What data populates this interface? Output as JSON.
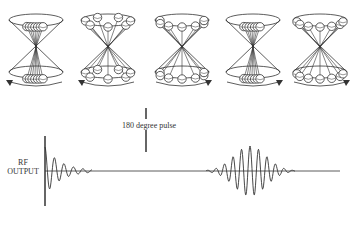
{
  "diagram": {
    "title": "",
    "cones": [
      {
        "id": 1,
        "state": "spins clustered in phase",
        "spread": 0.15,
        "rotation": "counterclockwise"
      },
      {
        "id": 2,
        "state": "spins dephased",
        "spread": 1.0,
        "rotation": "counterclockwise"
      },
      {
        "id": 3,
        "state": "spins dephasing / refocusing after inversion",
        "spread": 0.7,
        "rotation": "clockwise"
      },
      {
        "id": 4,
        "state": "spins rephased (echo)",
        "spread": 0.15,
        "rotation": "clockwise"
      },
      {
        "id": 5,
        "state": "spins dephasing again",
        "spread": 0.6,
        "rotation": "clockwise"
      }
    ],
    "pulse": {
      "label": "180 degree pulse",
      "x": 146
    },
    "signal": {
      "axis_label_line1": "RF",
      "axis_label_line2": "OUTPUT",
      "segments": [
        "free induction decay",
        "spin echo"
      ]
    },
    "colors": {
      "line": "#333333",
      "background": "#ffffff",
      "sphere_fill": "#ffffff"
    }
  }
}
